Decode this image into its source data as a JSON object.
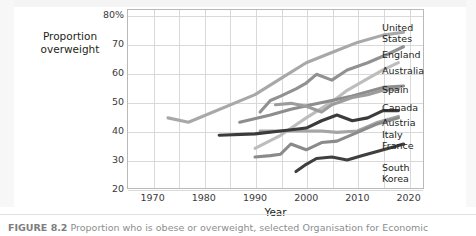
{
  "figure": {
    "caption_label": "FIGURE 8.2",
    "caption_text": "Proportion who is obese or overweight, selected Organisation for Economic"
  },
  "axes": {
    "y_title_line1": "Proportion",
    "y_title_line2": "overweight",
    "x_title": "Year",
    "y_ticks": [
      "80%",
      "70",
      "60",
      "50",
      "40",
      "30",
      "20"
    ],
    "x_ticks": [
      "1970",
      "1980",
      "1990",
      "2000",
      "2010",
      "2020"
    ]
  },
  "legend": {
    "entries": [
      {
        "name": "united-states",
        "lines": [
          "United",
          "States"
        ]
      },
      {
        "name": "england",
        "lines": [
          "England"
        ]
      },
      {
        "name": "australia",
        "lines": [
          "Australia"
        ]
      },
      {
        "name": "spain",
        "lines": [
          "Spain"
        ]
      },
      {
        "name": "canada",
        "lines": [
          "Canada"
        ]
      },
      {
        "name": "austria",
        "lines": [
          "Austria"
        ]
      },
      {
        "name": "italy",
        "lines": [
          "Italy"
        ]
      },
      {
        "name": "france",
        "lines": [
          "France"
        ]
      },
      {
        "name": "south-korea",
        "lines": [
          "South",
          "Korea"
        ]
      }
    ]
  },
  "chart_data": {
    "type": "line",
    "title": "",
    "xlabel": "Year",
    "ylabel": "Proportion overweight",
    "xlim": [
      1965,
      2023
    ],
    "ylim": [
      20,
      82
    ],
    "y_unit": "%",
    "grid": true,
    "legend_position": "right",
    "y_ticks": [
      20,
      30,
      40,
      50,
      60,
      70,
      80
    ],
    "x_ticks": [
      1970,
      1980,
      1990,
      2000,
      2010,
      2020
    ],
    "series": [
      {
        "name": "United States",
        "color": "#a8a8a8",
        "x": [
          1973,
          1977,
          1990,
          1995,
          2000,
          2005,
          2010,
          2015,
          2019
        ],
        "values": [
          44.5,
          43.0,
          52.5,
          58.0,
          63.5,
          67.0,
          70.5,
          73.0,
          74.0
        ]
      },
      {
        "name": "England",
        "color": "#919191",
        "x": [
          1991,
          1993,
          1995,
          1998,
          2000,
          2002,
          2005,
          2008,
          2012,
          2016,
          2019
        ],
        "values": [
          46.5,
          50.5,
          52.0,
          54.5,
          56.5,
          59.5,
          57.5,
          61.0,
          63.5,
          66.5,
          69.0
        ]
      },
      {
        "name": "Australia",
        "color": "#bdbdbd",
        "x": [
          1990,
          1995,
          2000,
          2005,
          2008,
          2012,
          2015,
          2018
        ],
        "values": [
          34.0,
          38.5,
          44.5,
          50.0,
          54.0,
          58.0,
          61.0,
          63.5
        ]
      },
      {
        "name": "Spain",
        "color": "#8d8d8d",
        "x": [
          1987,
          1993,
          1997,
          2001,
          2005,
          2009,
          2012,
          2015,
          2019
        ],
        "values": [
          43.0,
          45.5,
          47.5,
          49.0,
          50.5,
          52.0,
          53.5,
          55.0,
          55.5
        ]
      },
      {
        "name": "Canada",
        "color": "#9c9c9c",
        "x": [
          1994,
          1997,
          2000,
          2003,
          2005,
          2009,
          2012,
          2015,
          2018
        ],
        "values": [
          49.0,
          49.5,
          48.5,
          46.5,
          49.0,
          51.5,
          52.5,
          54.0,
          54.5
        ]
      },
      {
        "name": "Austria",
        "color": "#a5a5a5",
        "x": [
          1991,
          1995,
          1999,
          2003,
          2006,
          2010,
          2014,
          2018
        ],
        "values": [
          40.0,
          40.0,
          40.0,
          40.0,
          39.5,
          40.0,
          43.0,
          45.0
        ]
      },
      {
        "name": "Italy",
        "color": "#8a8a8a",
        "x": [
          1990,
          1993,
          1995,
          1997,
          2000,
          2003,
          2006,
          2010,
          2014,
          2018
        ],
        "values": [
          31.0,
          31.5,
          32.0,
          35.5,
          33.5,
          36.0,
          36.5,
          39.5,
          42.5,
          44.5
        ]
      },
      {
        "name": "France",
        "color": "#3b3b3b",
        "x": [
          1983,
          1990,
          1995,
          2000,
          2003,
          2006,
          2009,
          2012,
          2015,
          2018
        ],
        "values": [
          38.5,
          39.0,
          40.0,
          41.0,
          43.5,
          45.5,
          43.5,
          44.5,
          47.0,
          47.0
        ]
      },
      {
        "name": "South Korea",
        "color": "#3f3f3f",
        "x": [
          1998,
          2000,
          2002,
          2005,
          2008,
          2011,
          2014,
          2017,
          2019
        ],
        "values": [
          26.0,
          28.5,
          30.5,
          31.0,
          30.0,
          31.5,
          33.0,
          34.5,
          35.5
        ]
      }
    ]
  }
}
